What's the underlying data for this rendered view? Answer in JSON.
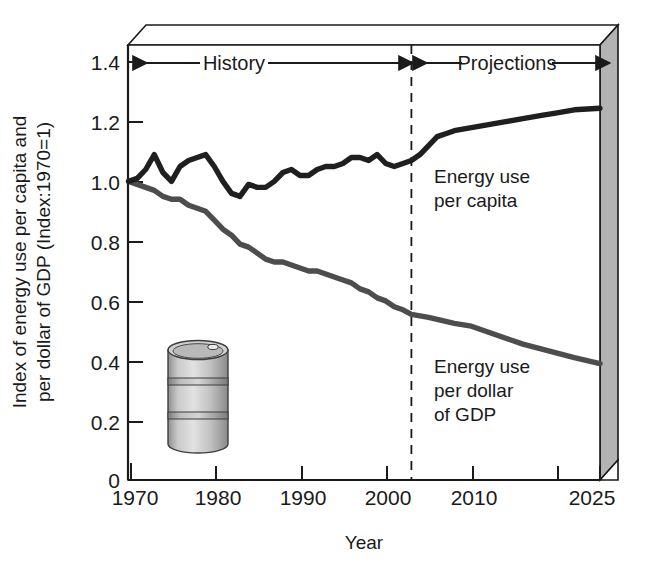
{
  "chart_data": {
    "type": "line",
    "title": "",
    "xlabel": "Year",
    "ylabel": "Index of energy use per capita and per dollar of GDP (Index:1970=1)",
    "xlim": [
      1970,
      2025
    ],
    "ylim": [
      0,
      1.45
    ],
    "grid": false,
    "legend_position": "inline-annotation",
    "x_ticks": [
      1970,
      1980,
      1990,
      2000,
      2010,
      2020,
      2025
    ],
    "x_tick_labels": [
      "1970",
      "1980",
      "1990",
      "2000",
      "2010",
      "",
      "2025"
    ],
    "y_ticks": [
      0,
      0.2,
      0.4,
      0.6,
      0.8,
      1.0,
      1.2,
      1.4
    ],
    "y_tick_labels": [
      "0",
      "0.2",
      "0.4",
      "0.6",
      "0.8",
      "1.0",
      "1.2",
      "1.4"
    ],
    "annotations": [
      {
        "name": "history-span",
        "label": "History",
        "from": 1970,
        "to": 2003
      },
      {
        "name": "projections-span",
        "label": "Projections",
        "from": 2003,
        "to": 2025
      },
      {
        "name": "history-projection-divider",
        "label": "",
        "at": 2003
      }
    ],
    "series": [
      {
        "name": "Energy use per capita",
        "color": "#1f1f1f",
        "x": [
          1970,
          1971,
          1972,
          1973,
          1974,
          1975,
          1976,
          1977,
          1978,
          1979,
          1980,
          1981,
          1982,
          1983,
          1984,
          1985,
          1986,
          1987,
          1988,
          1989,
          1990,
          1991,
          1992,
          1993,
          1994,
          1995,
          1996,
          1997,
          1998,
          1999,
          2000,
          2001,
          2002,
          2003,
          2004,
          2005,
          2006,
          2007,
          2008,
          2010,
          2012,
          2014,
          2016,
          2018,
          2020,
          2022,
          2025
        ],
        "y": [
          1.0,
          1.01,
          1.04,
          1.09,
          1.03,
          1.0,
          1.05,
          1.07,
          1.08,
          1.09,
          1.05,
          1.0,
          0.96,
          0.95,
          0.99,
          0.98,
          0.98,
          1.0,
          1.03,
          1.04,
          1.02,
          1.02,
          1.04,
          1.05,
          1.05,
          1.06,
          1.08,
          1.08,
          1.07,
          1.09,
          1.06,
          1.05,
          1.06,
          1.07,
          1.09,
          1.12,
          1.15,
          1.16,
          1.17,
          1.18,
          1.19,
          1.2,
          1.21,
          1.22,
          1.23,
          1.24,
          1.245
        ]
      },
      {
        "name": "Energy use per dollar of GDP",
        "color": "#4d4d4d",
        "x": [
          1970,
          1971,
          1972,
          1973,
          1974,
          1975,
          1976,
          1977,
          1978,
          1979,
          1980,
          1981,
          1982,
          1983,
          1984,
          1985,
          1986,
          1987,
          1988,
          1989,
          1990,
          1991,
          1992,
          1993,
          1994,
          1995,
          1996,
          1997,
          1998,
          1999,
          2000,
          2001,
          2002,
          2003,
          2005,
          2008,
          2010,
          2012,
          2014,
          2016,
          2018,
          2020,
          2022,
          2025
        ],
        "y": [
          1.0,
          0.99,
          0.98,
          0.97,
          0.95,
          0.94,
          0.94,
          0.92,
          0.91,
          0.9,
          0.87,
          0.84,
          0.82,
          0.79,
          0.78,
          0.76,
          0.74,
          0.73,
          0.73,
          0.72,
          0.71,
          0.7,
          0.7,
          0.69,
          0.68,
          0.67,
          0.66,
          0.64,
          0.63,
          0.61,
          0.6,
          0.58,
          0.57,
          0.555,
          0.545,
          0.525,
          0.515,
          0.495,
          0.475,
          0.455,
          0.44,
          0.425,
          0.41,
          0.39
        ]
      }
    ]
  },
  "decorations": {
    "oil_barrel": "oil-barrel-illustration",
    "box_face": "#ffffff",
    "box_side": "#b3b3b3",
    "box_top": "#ffffff"
  }
}
